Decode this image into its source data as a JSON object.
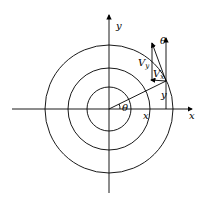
{
  "labels": {
    "x_axis": "x",
    "y_axis": "y",
    "theta_origin": "θ",
    "theta_top": "θ",
    "vy": "V",
    "vy_sub": "y",
    "vx": "V",
    "vx_sub": "x",
    "x": "x",
    "y": "y"
  }
}
